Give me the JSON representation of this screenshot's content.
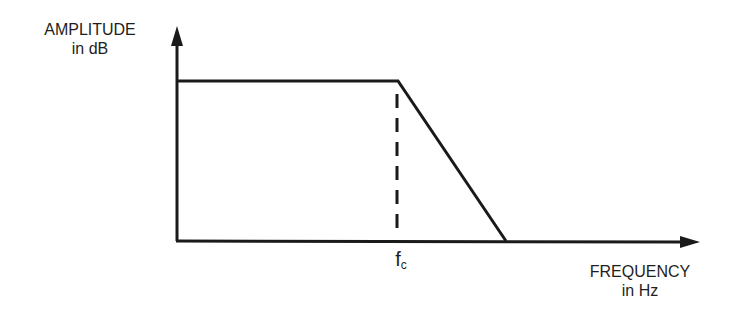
{
  "diagram": {
    "type": "low-pass filter frequency response",
    "y_axis": {
      "line1": "AMPLITUDE",
      "line2": "in dB"
    },
    "x_axis": {
      "line1": "FREQUENCY",
      "line2": "in Hz"
    },
    "cutoff_marker": {
      "main": "f",
      "sub": "c"
    },
    "colors": {
      "line": "#1a1a1a",
      "background": "#ffffff"
    }
  }
}
